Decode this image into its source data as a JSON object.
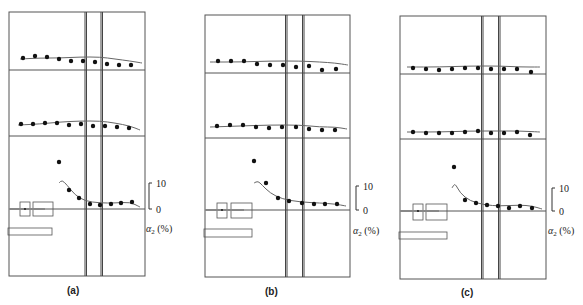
{
  "figure": {
    "panels": [
      {
        "id": "a",
        "label": "(a)",
        "frame": {
          "x": 9,
          "y": 12,
          "w": 136,
          "h": 264
        },
        "dividers_y": [
          70,
          136
        ],
        "zero_line_y": 209,
        "vlines_x": [
          85,
          86.5,
          101,
          102.5
        ],
        "rows": [
          {
            "name": "top-row",
            "dots": [
              [
                23,
                58
              ],
              [
                35,
                56
              ],
              [
                47,
                57
              ],
              [
                59,
                59
              ],
              [
                71,
                61
              ],
              [
                83,
                61
              ],
              [
                95,
                62
              ],
              [
                107,
                64
              ],
              [
                119,
                65
              ],
              [
                131,
                65
              ]
            ],
            "curve": [
              [
                20,
                59
              ],
              [
                40,
                58
              ],
              [
                60,
                58
              ],
              [
                80,
                57
              ],
              [
                100,
                57
              ],
              [
                115,
                59
              ],
              [
                130,
                61
              ],
              [
                142,
                63
              ]
            ]
          },
          {
            "name": "middle-row",
            "dots": [
              [
                21,
                124
              ],
              [
                33,
                124
              ],
              [
                45,
                123
              ],
              [
                57,
                123
              ],
              [
                69,
                125
              ],
              [
                81,
                124
              ],
              [
                93,
                126
              ],
              [
                105,
                126
              ],
              [
                117,
                127
              ],
              [
                129,
                128
              ]
            ],
            "curve": [
              [
                18,
                125
              ],
              [
                40,
                124
              ],
              [
                60,
                122
              ],
              [
                80,
                121
              ],
              [
                100,
                121
              ],
              [
                115,
                123
              ],
              [
                130,
                126
              ],
              [
                140,
                130
              ]
            ]
          },
          {
            "name": "bottom-row",
            "dots": [
              [
                59,
                162
              ],
              [
                69,
                190
              ],
              [
                79,
                198
              ],
              [
                90,
                204
              ],
              [
                100,
                205
              ],
              [
                111,
                204
              ],
              [
                121,
                203
              ],
              [
                132,
                202
              ]
            ],
            "curve": [
              [
                59,
                183
              ],
              [
                62,
                180
              ],
              [
                67,
                185
              ],
              [
                75,
                195
              ],
              [
                85,
                201
              ],
              [
                100,
                203
              ],
              [
                115,
                203
              ],
              [
                130,
                202
              ],
              [
                140,
                207
              ]
            ]
          }
        ],
        "components": {
          "box1": {
            "x": 20,
            "y": 202,
            "w": 10,
            "h": 14
          },
          "box2": {
            "x": 33,
            "y": 202,
            "w": 20,
            "h": 14
          },
          "bar": {
            "x": 8,
            "y": 228,
            "w": 44,
            "h": 7
          }
        },
        "scale": {
          "x": 149,
          "y_top": 183,
          "y_bottom": 209,
          "label_x": 156,
          "axis_label_x": 146,
          "axis_label_y": 232
        }
      },
      {
        "id": "b",
        "label": "(b)",
        "frame": {
          "x": 205,
          "y": 15,
          "w": 145,
          "h": 262
        },
        "dividers_y": [
          73,
          138
        ],
        "zero_line_y": 210,
        "vlines_x": [
          285.5,
          287,
          302.5,
          304
        ],
        "rows": [
          {
            "name": "top-row",
            "dots": [
              [
                218,
                61
              ],
              [
                231,
                61
              ],
              [
                244,
                61
              ],
              [
                257,
                64
              ],
              [
                270,
                65
              ],
              [
                283,
                65
              ],
              [
                296,
                67
              ],
              [
                309,
                66
              ],
              [
                322,
                70
              ],
              [
                336,
                69
              ]
            ],
            "curve": [
              [
                210,
                62
              ],
              [
                240,
                62
              ],
              [
                270,
                61
              ],
              [
                300,
                61
              ],
              [
                320,
                62
              ],
              [
                335,
                63
              ],
              [
                348,
                65
              ]
            ]
          },
          {
            "name": "middle-row",
            "dots": [
              [
                217,
                126
              ],
              [
                230,
                125
              ],
              [
                243,
                125
              ],
              [
                256,
                127
              ],
              [
                269,
                128
              ],
              [
                282,
                127
              ],
              [
                296,
                127
              ],
              [
                309,
                129
              ],
              [
                322,
                130
              ],
              [
                335,
                130
              ]
            ],
            "curve": [
              [
                210,
                127
              ],
              [
                240,
                126
              ],
              [
                270,
                125
              ],
              [
                300,
                125
              ],
              [
                320,
                127
              ],
              [
                335,
                127
              ],
              [
                347,
                129
              ]
            ]
          },
          {
            "name": "bottom-row",
            "dots": [
              [
                254,
                161
              ],
              [
                266,
                183
              ],
              [
                278,
                198
              ],
              [
                289,
                201
              ],
              [
                302,
                203
              ],
              [
                314,
                204
              ],
              [
                325,
                204
              ],
              [
                337,
                204
              ]
            ],
            "curve": [
              [
                254,
                183
              ],
              [
                258,
                181
              ],
              [
                262,
                185
              ],
              [
                270,
                193
              ],
              [
                282,
                199
              ],
              [
                300,
                202
              ],
              [
                320,
                203
              ],
              [
                335,
                204
              ],
              [
                346,
                206
              ]
            ]
          }
        ],
        "components": {
          "box1": {
            "x": 217,
            "y": 203,
            "w": 10,
            "h": 15
          },
          "box2": {
            "x": 231,
            "y": 203,
            "w": 21,
            "h": 15
          },
          "bar": {
            "x": 204,
            "y": 229,
            "w": 48,
            "h": 8
          }
        },
        "scale": {
          "x": 356,
          "y_top": 186,
          "y_bottom": 210,
          "label_x": 363,
          "axis_label_x": 353,
          "axis_label_y": 234
        }
      },
      {
        "id": "c",
        "label": "(c)",
        "frame": {
          "x": 400,
          "y": 16,
          "w": 146,
          "h": 263
        },
        "dividers_y": [
          74,
          139
        ],
        "zero_line_y": 211,
        "vlines_x": [
          481.5,
          483,
          498.5,
          500
        ],
        "rows": [
          {
            "name": "top-row",
            "dots": [
              [
                413,
                68
              ],
              [
                426,
                69
              ],
              [
                439,
                70
              ],
              [
                452,
                69
              ],
              [
                465,
                68
              ],
              [
                478,
                68
              ],
              [
                491,
                69
              ],
              [
                504,
                69
              ],
              [
                517,
                69
              ],
              [
                531,
                72
              ]
            ],
            "curve": [
              [
                407,
                67
              ],
              [
                440,
                67
              ],
              [
                470,
                66
              ],
              [
                500,
                66
              ],
              [
                520,
                67
              ],
              [
                540,
                67
              ]
            ]
          },
          {
            "name": "middle-row",
            "dots": [
              [
                413,
                132
              ],
              [
                426,
                133
              ],
              [
                439,
                133
              ],
              [
                452,
                133
              ],
              [
                465,
                132
              ],
              [
                478,
                131
              ],
              [
                491,
                133
              ],
              [
                504,
                133
              ],
              [
                517,
                132
              ],
              [
                530,
                135
              ]
            ],
            "curve": [
              [
                407,
                132
              ],
              [
                440,
                132
              ],
              [
                470,
                131
              ],
              [
                500,
                131
              ],
              [
                520,
                131
              ],
              [
                540,
                132
              ]
            ]
          },
          {
            "name": "bottom-row",
            "dots": [
              [
                454,
                167
              ],
              [
                465,
                200
              ],
              [
                476,
                203
              ],
              [
                487,
                205
              ],
              [
                498,
                206
              ],
              [
                509,
                208
              ],
              [
                520,
                206
              ],
              [
                532,
                208
              ]
            ],
            "curve": [
              [
                452,
                188
              ],
              [
                455,
                183
              ],
              [
                460,
                193
              ],
              [
                470,
                201
              ],
              [
                485,
                205
              ],
              [
                500,
                206
              ],
              [
                520,
                205
              ],
              [
                532,
                206
              ],
              [
                542,
                209
              ]
            ]
          }
        ],
        "components": {
          "box1": {
            "x": 413,
            "y": 204,
            "w": 10,
            "h": 16
          },
          "box2": {
            "x": 426,
            "y": 204,
            "w": 21,
            "h": 16
          },
          "bar": {
            "x": 399,
            "y": 232,
            "w": 48,
            "h": 7
          }
        },
        "scale": {
          "x": 552,
          "y_top": 188,
          "y_bottom": 211,
          "label_x": 559,
          "axis_label_x": 548,
          "axis_label_y": 234
        }
      }
    ],
    "scale_labels": {
      "top": "10",
      "bottom": "0"
    },
    "axis_label": {
      "symbol": "α",
      "subscript": "2",
      "unit": " (%)"
    },
    "panel_label_positions": [
      [
        67,
        294
      ],
      [
        265,
        295
      ],
      [
        461,
        296
      ]
    ],
    "colors": {
      "line": "#555555",
      "dot": "#111111",
      "curve": "#666666"
    }
  }
}
